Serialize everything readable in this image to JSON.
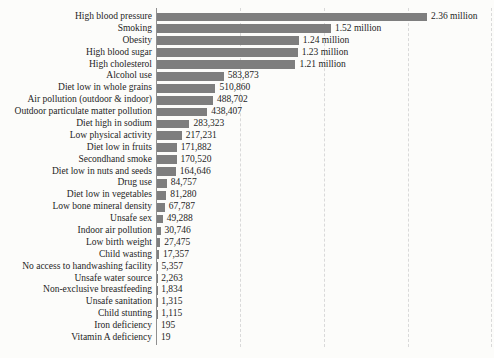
{
  "colors": {
    "bar": "#7e7e7e",
    "axis": "#8f8f8f",
    "grid": "#d9d9d9",
    "text": "#1e1e1e",
    "background": "#fcfcfa"
  },
  "chart_data": {
    "type": "bar",
    "orientation": "horizontal",
    "title": "",
    "xlabel": "",
    "ylabel": "",
    "grid": "vertical-dashed",
    "legend": "none",
    "xlim": [
      0,
      2960000
    ],
    "categories": [
      "High blood pressure",
      "Smoking",
      "Obesity",
      "High blood sugar",
      "High cholesterol",
      "Alcohol use",
      "Diet low in whole grains",
      "Air pollution (outdoor & indoor)",
      "Outdoor particulate matter pollution",
      "Diet high in sodium",
      "Low physical activity",
      "Diet low in fruits",
      "Secondhand smoke",
      "Diet low in nuts and seeds",
      "Drug use",
      "Diet low in vegetables",
      "Low bone mineral density",
      "Unsafe sex",
      "Indoor air pollution",
      "Low birth weight",
      "Child wasting",
      "No access to handwashing facility",
      "Unsafe water source",
      "Non-exclusive breastfeeding",
      "Unsafe sanitation",
      "Child stunting",
      "Iron deficiency",
      "Vitamin A deficiency"
    ],
    "values": [
      2360000,
      1520000,
      1240000,
      1230000,
      1210000,
      583873,
      510860,
      488702,
      438407,
      283323,
      217231,
      171882,
      170520,
      164646,
      84757,
      81280,
      67787,
      49288,
      30746,
      27475,
      17357,
      5357,
      2263,
      1834,
      1315,
      1115,
      195,
      19
    ],
    "value_labels": [
      "2.36 million",
      "1.52 million",
      "1.24 million",
      "1.23 million",
      "1.21 million",
      "583,873",
      "510,860",
      "488,702",
      "438,407",
      "283,323",
      "217,231",
      "171,882",
      "170,520",
      "164,646",
      "84,757",
      "81,280",
      "67,787",
      "49,288",
      "30,746",
      "27,475",
      "17,357",
      "5,357",
      "2,263",
      "1,834",
      "1,315",
      "1,115",
      "195",
      "19"
    ]
  }
}
